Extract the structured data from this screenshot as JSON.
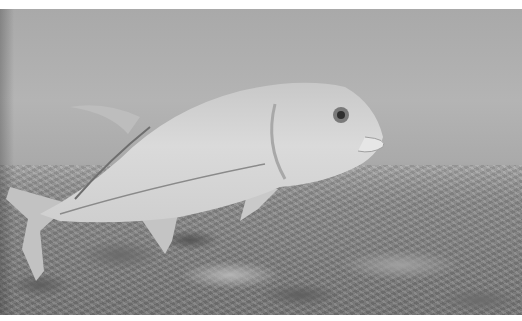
{
  "image": {
    "description": "Grayscale underwater photograph of a giant trevally swimming over a coral/rubble seafloor",
    "subject": "giant trevally fish",
    "palette": {
      "water_top": "#a9a9a9",
      "water_mid": "#b4b4b4",
      "seafloor": "#7c7c7c",
      "fish_body": "#d4d4d4",
      "fish_shadow": "#9c9c9c",
      "border": "#ffffff"
    }
  }
}
